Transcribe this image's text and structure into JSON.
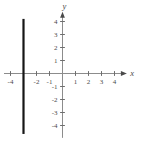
{
  "figure": {
    "background": "#ffffff",
    "axis_color": "#8c8c8c",
    "tick_color": "#6e6e6e",
    "label_color": "#4a4a4a",
    "plot_line_color": "#161616",
    "x_axis_letter": "x",
    "y_axis_letter": "y"
  },
  "chart_data": {
    "type": "line",
    "title": "",
    "xlabel": "x",
    "ylabel": "y",
    "xlim": [
      -4.5,
      4.95
    ],
    "ylim": [
      -4.95,
      4.75
    ],
    "grid": false,
    "legend": "none",
    "x_ticks": [
      -4,
      -3,
      -2,
      -1,
      1,
      2,
      3,
      4
    ],
    "y_ticks": [
      -4,
      -3,
      -2,
      -1,
      1,
      2,
      3,
      4
    ],
    "x_tick_labels": [
      {
        "value": -4,
        "label": "-4"
      },
      {
        "value": -2,
        "label": "-2"
      },
      {
        "value": -1,
        "label": "-1"
      },
      {
        "value": 1,
        "label": "1"
      },
      {
        "value": 2,
        "label": "2"
      },
      {
        "value": 3,
        "label": "3"
      },
      {
        "value": 4,
        "label": "4"
      }
    ],
    "y_tick_labels": [
      {
        "value": 4,
        "label": "4"
      },
      {
        "value": 3,
        "label": "3"
      },
      {
        "value": 2,
        "label": "2"
      },
      {
        "value": 1,
        "label": "1"
      },
      {
        "value": -1,
        "label": "-1"
      },
      {
        "value": -2,
        "label": "-2"
      },
      {
        "value": -3,
        "label": "-3"
      },
      {
        "value": -4,
        "label": "-4"
      }
    ],
    "series": [
      {
        "name": "vertical-line",
        "equation": "x = -3",
        "points": [
          {
            "x": -3,
            "y": 4.2
          },
          {
            "x": -3,
            "y": -4.65
          }
        ]
      }
    ]
  }
}
